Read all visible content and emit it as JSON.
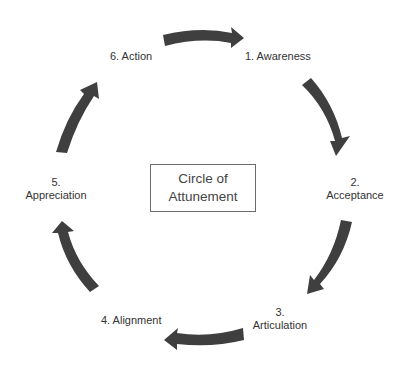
{
  "diagram": {
    "title_line1": "Circle of",
    "title_line2": "Attunement",
    "arrow_color": "#3f3f3f",
    "steps": [
      {
        "number": "1.",
        "name": "Awareness",
        "full": "1. Awareness"
      },
      {
        "number": "2.",
        "name": "Acceptance"
      },
      {
        "number": "3.",
        "name": "Articulation"
      },
      {
        "number": "4.",
        "name": "Alignment",
        "full": "4. Alignment"
      },
      {
        "number": "5.",
        "name": "Appreciation"
      },
      {
        "number": "6.",
        "name": "Action",
        "full": "6. Action"
      }
    ]
  }
}
